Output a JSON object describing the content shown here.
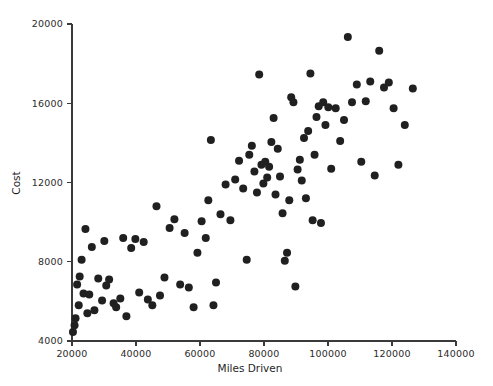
{
  "chart_data": {
    "type": "scatter",
    "title": "",
    "xlabel": "Miles Driven",
    "ylabel": "Cost",
    "xlim": [
      20000,
      140000
    ],
    "ylim": [
      4000,
      20000
    ],
    "xticks": [
      20000,
      40000,
      60000,
      80000,
      100000,
      120000,
      140000
    ],
    "yticks": [
      4000,
      8000,
      12000,
      16000,
      20000
    ],
    "xticklabels": [
      "20000",
      "40000",
      "60000",
      "80000",
      "100000",
      "120000",
      "140000"
    ],
    "yticklabels": [
      "4000",
      "8000",
      "12000",
      "16000",
      "20000"
    ],
    "grid": false,
    "legend": null,
    "marker": "filled-circle",
    "marker_color": "#202020",
    "marker_size": 5.2,
    "series": [
      {
        "name": "vehicles",
        "points": [
          [
            20300,
            4450
          ],
          [
            20800,
            4800
          ],
          [
            21100,
            5150
          ],
          [
            21600,
            6850
          ],
          [
            22100,
            5800
          ],
          [
            22400,
            7250
          ],
          [
            23000,
            8100
          ],
          [
            23600,
            6400
          ],
          [
            24200,
            9650
          ],
          [
            24800,
            5400
          ],
          [
            25400,
            6350
          ],
          [
            26200,
            8750
          ],
          [
            27000,
            5550
          ],
          [
            28200,
            7150
          ],
          [
            29400,
            6050
          ],
          [
            30100,
            9050
          ],
          [
            30700,
            6800
          ],
          [
            31600,
            7100
          ],
          [
            33000,
            5900
          ],
          [
            33800,
            5700
          ],
          [
            35100,
            6150
          ],
          [
            36000,
            9200
          ],
          [
            37000,
            5250
          ],
          [
            38500,
            8700
          ],
          [
            39800,
            9150
          ],
          [
            41000,
            6450
          ],
          [
            42400,
            9000
          ],
          [
            43700,
            6100
          ],
          [
            45100,
            5800
          ],
          [
            46400,
            10800
          ],
          [
            47500,
            6300
          ],
          [
            48900,
            7200
          ],
          [
            50500,
            9700
          ],
          [
            52000,
            10150
          ],
          [
            53800,
            6850
          ],
          [
            55200,
            9450
          ],
          [
            56500,
            6700
          ],
          [
            58000,
            5700
          ],
          [
            59200,
            8450
          ],
          [
            60500,
            10050
          ],
          [
            61800,
            9200
          ],
          [
            62600,
            11100
          ],
          [
            63400,
            14150
          ],
          [
            64200,
            5800
          ],
          [
            65000,
            6950
          ],
          [
            66400,
            10400
          ],
          [
            68000,
            11900
          ],
          [
            69500,
            10100
          ],
          [
            71000,
            12150
          ],
          [
            72200,
            13100
          ],
          [
            73500,
            11700
          ],
          [
            74600,
            8100
          ],
          [
            75400,
            13400
          ],
          [
            76200,
            13850
          ],
          [
            77000,
            12550
          ],
          [
            77800,
            11500
          ],
          [
            78500,
            17450
          ],
          [
            79200,
            12900
          ],
          [
            79800,
            11950
          ],
          [
            80400,
            13050
          ],
          [
            81000,
            12250
          ],
          [
            81600,
            12800
          ],
          [
            82300,
            14050
          ],
          [
            83000,
            15250
          ],
          [
            83600,
            11400
          ],
          [
            84300,
            13700
          ],
          [
            85000,
            12300
          ],
          [
            85800,
            10450
          ],
          [
            86500,
            8050
          ],
          [
            87200,
            8450
          ],
          [
            87900,
            11100
          ],
          [
            88500,
            16300
          ],
          [
            89200,
            16050
          ],
          [
            89800,
            6750
          ],
          [
            90500,
            12650
          ],
          [
            91200,
            13150
          ],
          [
            91800,
            12100
          ],
          [
            92500,
            14250
          ],
          [
            93100,
            11200
          ],
          [
            93800,
            14600
          ],
          [
            94500,
            17500
          ],
          [
            95200,
            10100
          ],
          [
            95800,
            13400
          ],
          [
            96400,
            15300
          ],
          [
            97100,
            15850
          ],
          [
            97800,
            9950
          ],
          [
            98500,
            16050
          ],
          [
            99200,
            14900
          ],
          [
            100100,
            15800
          ],
          [
            101000,
            12700
          ],
          [
            102400,
            15750
          ],
          [
            103800,
            14100
          ],
          [
            105000,
            15150
          ],
          [
            106200,
            19350
          ],
          [
            107500,
            16050
          ],
          [
            109000,
            16950
          ],
          [
            110400,
            13050
          ],
          [
            111800,
            16100
          ],
          [
            113200,
            17100
          ],
          [
            114600,
            12350
          ],
          [
            116000,
            18650
          ],
          [
            117500,
            16800
          ],
          [
            119000,
            17050
          ],
          [
            120500,
            15750
          ],
          [
            122000,
            12900
          ],
          [
            124000,
            14900
          ],
          [
            126500,
            16750
          ]
        ]
      }
    ]
  },
  "axes": {
    "y_axis_label": "Cost",
    "x_axis_label": "Miles Driven"
  }
}
